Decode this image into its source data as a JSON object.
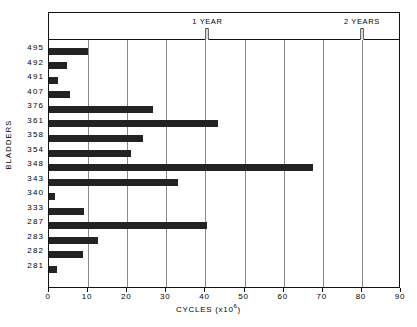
{
  "chart_data": {
    "type": "bar",
    "orientation": "horizontal",
    "title": "",
    "xlabel": "CYCLES (x10⁶)",
    "ylabel": "BLADDERS",
    "xlim": [
      0,
      90
    ],
    "xticks": [
      0,
      10,
      20,
      30,
      40,
      50,
      60,
      70,
      80,
      90
    ],
    "xtick_labels": [
      "0",
      "10",
      "20",
      "30",
      "40",
      "50",
      "60",
      "70",
      "80",
      "90"
    ],
    "grid": "vertical",
    "legend": "none",
    "categories": [
      "495",
      "492",
      "491",
      "407",
      "376",
      "361",
      "358",
      "354",
      "348",
      "343",
      "340",
      "333",
      "287",
      "283",
      "282",
      "281"
    ],
    "values": [
      10.0,
      4.5,
      2.3,
      5.3,
      26.5,
      43.2,
      24.0,
      21.0,
      67.5,
      33.0,
      1.6,
      9.0,
      40.5,
      12.5,
      8.7,
      2.0
    ],
    "annotations": [
      {
        "label": "1 YEAR",
        "x": 40.5,
        "marker": "down-arrow"
      },
      {
        "label": "2 YEARS",
        "x": 80.0,
        "marker": "down-arrow"
      }
    ],
    "colors": {
      "bar": "#232323",
      "grid": "#8a8a8a",
      "frame": "#111111"
    }
  },
  "caption": ""
}
